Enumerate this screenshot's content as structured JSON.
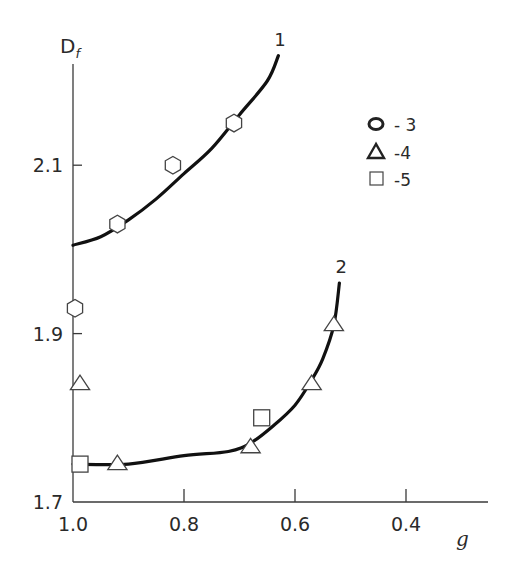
{
  "chart_data": {
    "type": "scatter",
    "title": "",
    "xlabel": "g",
    "ylabel": "D_f",
    "ylabel_main": "D",
    "ylabel_sub": "f",
    "xlim": [
      1.0,
      0.3
    ],
    "ylim": [
      1.7,
      2.25
    ],
    "x_reversed": true,
    "grid": false,
    "legend_position": "upper right",
    "x_ticks": [
      1.0,
      0.8,
      0.6,
      0.4
    ],
    "x_tick_labels": [
      "1.0",
      "0.8",
      "0.6",
      "0.4"
    ],
    "y_ticks": [
      1.7,
      1.9,
      2.1
    ],
    "y_tick_labels": [
      "1.7",
      "1.9",
      "2.1"
    ],
    "curves": [
      {
        "name": "1",
        "label": "1",
        "x": [
          1.0,
          0.95,
          0.9,
          0.85,
          0.8,
          0.75,
          0.7,
          0.65,
          0.63
        ],
        "y": [
          2.005,
          2.015,
          2.035,
          2.06,
          2.09,
          2.12,
          2.16,
          2.2,
          2.23
        ]
      },
      {
        "name": "2",
        "label": "2",
        "x": [
          1.0,
          0.9,
          0.8,
          0.72,
          0.68,
          0.64,
          0.6,
          0.57,
          0.55,
          0.53,
          0.52
        ],
        "y": [
          1.745,
          1.745,
          1.755,
          1.76,
          1.77,
          1.79,
          1.815,
          1.845,
          1.87,
          1.91,
          1.96
        ]
      }
    ],
    "series": [
      {
        "name": "3",
        "marker": "circle",
        "x": [
          1.0,
          0.92,
          0.82,
          0.71
        ],
        "y": [
          1.93,
          2.03,
          2.1,
          2.15
        ]
      },
      {
        "name": "4",
        "marker": "triangle",
        "x": [
          1.0,
          0.92,
          0.68,
          0.57,
          0.53
        ],
        "y": [
          1.84,
          1.745,
          1.765,
          1.84,
          1.91
        ]
      },
      {
        "name": "5",
        "marker": "square",
        "x": [
          1.0,
          0.66
        ],
        "y": [
          1.745,
          1.8
        ]
      }
    ],
    "legend": [
      {
        "marker": "circle",
        "glyph": "O",
        "label": "- 3"
      },
      {
        "marker": "triangle",
        "glyph": "Δ",
        "label": "-4"
      },
      {
        "marker": "square",
        "glyph": "□",
        "label": "-5"
      }
    ],
    "colors": {
      "axis": "#3a3a3a",
      "curve": "#111111",
      "marker_stroke": "#444444",
      "background": "#ffffff"
    }
  }
}
